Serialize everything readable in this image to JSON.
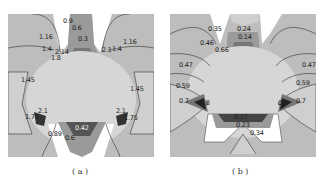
{
  "figure": {
    "panels": [
      {
        "id": "a",
        "caption": "( a )",
        "contour_labels": [
          "0.9",
          "0.6",
          "0.3",
          "1.16",
          "1.16",
          "1.4",
          "1.4",
          "2.14",
          "1.8",
          "2.1",
          "1.45",
          "1.45",
          "2.1",
          "1.75",
          "2.1",
          "1.75",
          "0.89",
          "0.6",
          "0.42"
        ]
      },
      {
        "id": "b",
        "caption": "( b )",
        "contour_labels": [
          "0.35",
          "0.24",
          "0.14",
          "0.46",
          "0.66",
          "0.47",
          "0.47",
          "0.59",
          "0.59",
          "0.7",
          "0.8",
          "0.8",
          "0.7",
          "0.17",
          "0.23",
          "0.34"
        ]
      }
    ],
    "colors": {
      "background": "#bdbdbd",
      "light_region": "#d8d8d8",
      "white_region": "#ffffff",
      "mid_dark": "#8a8a8a",
      "dark": "#4a4a4a",
      "darkest": "#1a1a1a",
      "contour_line": "#333333"
    }
  }
}
